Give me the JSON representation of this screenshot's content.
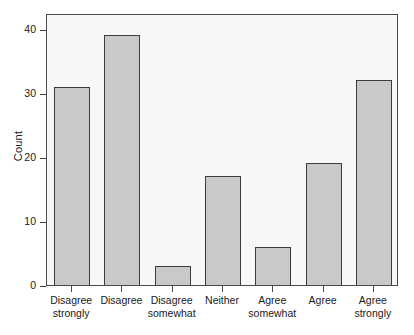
{
  "chart_data": {
    "type": "bar",
    "title": "",
    "subtitle": "",
    "xlabel": "",
    "ylabel": "Count",
    "categories": [
      "Disagree strongly",
      "Disagree",
      "Disagree somewhat",
      "Neither",
      "Agree somewhat",
      "Agree",
      "Agree strongly"
    ],
    "category_lines": [
      "Disagree\nstrongly",
      "Disagree",
      "Disagree\nsomewhat",
      "Neither",
      "Agree\nsomewhat",
      "Agree",
      "Agree\nstrongly"
    ],
    "values": [
      31,
      39,
      3,
      17,
      6,
      19,
      32
    ],
    "ylim": [
      0,
      42.5
    ],
    "yticks": [
      0,
      10,
      20,
      30,
      40
    ],
    "ytick_labels": [
      "0",
      "10",
      "20",
      "30",
      "40"
    ],
    "grid": false,
    "legend": "none",
    "bar_fill_color": "#c9c9c9",
    "bar_border_color": "#3c3c3c",
    "panel_background_color": "#f7f7f7",
    "panel_border_color": "#4a4a4a",
    "text_color": "#1a1a1a"
  }
}
